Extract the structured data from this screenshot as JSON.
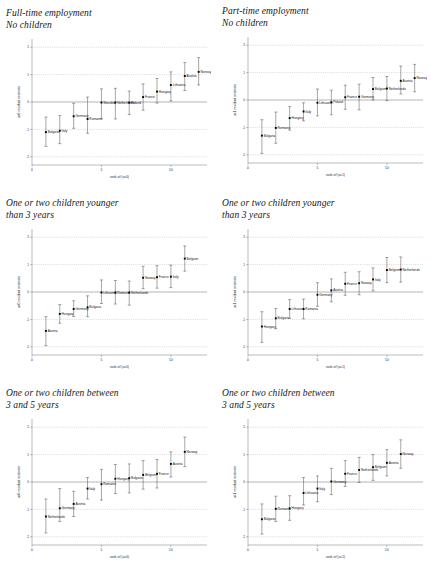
{
  "figure": {
    "width": 431,
    "height": 577,
    "background": "#ffffff",
    "marker_color": "#000000",
    "grid_color": "#9a9a9a",
    "axis_color": "#666666"
  },
  "panels": [
    {
      "id": "panel-fulltime-nochildren",
      "title": "Full-time employment\nNo children",
      "chart_data": {
        "type": "scatter",
        "title": "Full-time employment No children",
        "xlabel": "rank of (uc0)",
        "ylabel": "uc0 residual estimate",
        "xlim": [
          0,
          12.6
        ],
        "ylim": [
          -2.3,
          2.3
        ],
        "xticks": [
          0,
          5,
          10
        ],
        "xticklabels": [
          "0",
          "5",
          "10"
        ],
        "yticks": [
          -2,
          -1,
          0,
          1,
          2
        ],
        "yticklabels": [
          "-2",
          "-1",
          "0",
          "1",
          "2"
        ],
        "grid": true,
        "zero_reference_line": 0,
        "legend": "none",
        "categories": [
          "Bulgaria",
          "Italy",
          "Germany",
          "Romania",
          "Hungary",
          "Poland",
          "Netherlands",
          "France",
          "Hungary",
          "Lithuania",
          "Austria",
          "Norway"
        ],
        "points": [
          {
            "x": 1,
            "label": "Bulgaria",
            "y": -1.1,
            "lo": -1.62,
            "hi": -0.55
          },
          {
            "x": 2,
            "label": "Italy",
            "y": -1.05,
            "lo": -1.52,
            "hi": -0.5
          },
          {
            "x": 3,
            "label": "Germany",
            "y": -0.52,
            "lo": -0.96,
            "hi": -0.05
          },
          {
            "x": 4,
            "label": "Romania",
            "y": -0.62,
            "lo": -1.14,
            "hi": 0.18
          },
          {
            "x": 5,
            "label": "Slovakia",
            "y": -0.02,
            "lo": -0.6,
            "hi": 0.48
          },
          {
            "x": 6,
            "label": "Netherlands",
            "y": -0.02,
            "lo": -0.62,
            "hi": 0.5
          },
          {
            "x": 7,
            "label": "Poland",
            "y": -0.02,
            "lo": -0.46,
            "hi": 0.4
          },
          {
            "x": 8,
            "label": "France",
            "y": 0.18,
            "lo": -0.3,
            "hi": 0.66
          },
          {
            "x": 9,
            "label": "Hungary",
            "y": 0.38,
            "lo": -0.04,
            "hi": 0.86
          },
          {
            "x": 10,
            "label": "Lithuania",
            "y": 0.62,
            "lo": 0.04,
            "hi": 1.1
          },
          {
            "x": 11,
            "label": "Austria",
            "y": 0.95,
            "lo": 0.42,
            "hi": 1.44
          },
          {
            "x": 12,
            "label": "Norway",
            "y": 1.1,
            "lo": 0.62,
            "hi": 1.62
          }
        ]
      }
    },
    {
      "id": "panel-parttime-nochildren",
      "title": "Part-time employment\nNo children",
      "chart_data": {
        "type": "scatter",
        "title": "Part-time employment No children",
        "xlabel": "rank of (uc1)",
        "ylabel": "uc1 residual estimate",
        "xlim": [
          0,
          12.6
        ],
        "ylim": [
          -2.3,
          2.3
        ],
        "xticks": [
          0,
          5,
          10
        ],
        "xticklabels": [
          "0",
          "5",
          "10"
        ],
        "yticks": [
          -2,
          -1,
          0,
          1,
          2
        ],
        "yticklabels": [
          "-2",
          "-1",
          "0",
          "1",
          "2"
        ],
        "grid": true,
        "zero_reference_line": 0,
        "legend": "none",
        "categories": [
          "Bulgaria",
          "Romania",
          "Hungary",
          "Italy",
          "Lithuania",
          "France",
          "Germany",
          "Belgium",
          "Netherlands",
          "Austria",
          "Norway"
        ],
        "points": [
          {
            "x": 1,
            "label": "Bulgaria",
            "y": -1.3,
            "lo": -1.95,
            "hi": -0.72
          },
          {
            "x": 2,
            "label": "Romania",
            "y": -1.02,
            "lo": -1.58,
            "hi": -0.44
          },
          {
            "x": 3,
            "label": "Hungary",
            "y": -0.66,
            "lo": -1.1,
            "hi": -0.24
          },
          {
            "x": 4,
            "label": "Italy",
            "y": -0.42,
            "lo": -0.76,
            "hi": -0.1
          },
          {
            "x": 5,
            "label": "Lithuania",
            "y": -0.1,
            "lo": -0.58,
            "hi": 0.4
          },
          {
            "x": 6,
            "label": "Poland",
            "y": -0.08,
            "lo": -0.54,
            "hi": 0.36
          },
          {
            "x": 7,
            "label": "France",
            "y": 0.1,
            "lo": -0.34,
            "hi": 0.54
          },
          {
            "x": 8,
            "label": "Germany",
            "y": 0.12,
            "lo": -0.36,
            "hi": 0.58
          },
          {
            "x": 9,
            "label": "Belgium",
            "y": 0.4,
            "lo": 0.0,
            "hi": 0.82
          },
          {
            "x": 10,
            "label": "Netherlands",
            "y": 0.42,
            "lo": -0.02,
            "hi": 0.86
          },
          {
            "x": 11,
            "label": "Austria",
            "y": 0.7,
            "lo": 0.22,
            "hi": 1.24
          },
          {
            "x": 12,
            "label": "Norway",
            "y": 0.8,
            "lo": 0.3,
            "hi": 1.3
          }
        ]
      }
    },
    {
      "id": "panel-younger3-uc0",
      "title": "One or two children younger\nthan 3 years",
      "chart_data": {
        "type": "scatter",
        "title": "One or two children younger than 3 years",
        "xlabel": "rank of (uc0)",
        "ylabel": "uc0 residual estimate",
        "xlim": [
          0,
          12.6
        ],
        "ylim": [
          -2.3,
          2.3
        ],
        "xticks": [
          0,
          5,
          10
        ],
        "xticklabels": [
          "0",
          "5",
          "10"
        ],
        "yticks": [
          -2,
          -1,
          0,
          1,
          2
        ],
        "yticklabels": [
          "-2",
          "-1",
          "0",
          "1",
          "2"
        ],
        "grid": true,
        "zero_reference_line": 0,
        "legend": "none",
        "categories": [
          "Austria",
          "Hungary",
          "Germany",
          "Bulgaria",
          "Lithuania",
          "Romania",
          "Netherlands",
          "Norway",
          "France",
          "Italy",
          "Belgium"
        ],
        "points": [
          {
            "x": 1,
            "label": "Austria",
            "y": -1.42,
            "lo": -1.96,
            "hi": -0.9
          },
          {
            "x": 2,
            "label": "Hungary",
            "y": -0.8,
            "lo": -1.14,
            "hi": -0.46
          },
          {
            "x": 3,
            "label": "Germany",
            "y": -0.62,
            "lo": -0.9,
            "hi": -0.32
          },
          {
            "x": 4,
            "label": "Bulgaria",
            "y": -0.56,
            "lo": -0.9,
            "hi": -0.14
          },
          {
            "x": 5,
            "label": "Lithuania",
            "y": -0.02,
            "lo": -0.42,
            "hi": 0.44
          },
          {
            "x": 6,
            "label": "Romania",
            "y": -0.02,
            "lo": -0.44,
            "hi": 0.42
          },
          {
            "x": 7,
            "label": "Netherlands",
            "y": -0.02,
            "lo": -0.48,
            "hi": 0.4
          },
          {
            "x": 8,
            "label": "Norway",
            "y": 0.52,
            "lo": 0.12,
            "hi": 0.94
          },
          {
            "x": 9,
            "label": "France",
            "y": 0.54,
            "lo": 0.14,
            "hi": 0.96
          },
          {
            "x": 10,
            "label": "Italy",
            "y": 0.56,
            "lo": 0.16,
            "hi": 0.98
          },
          {
            "x": 11,
            "label": "Belgium",
            "y": 1.22,
            "lo": 0.76,
            "hi": 1.68
          }
        ]
      }
    },
    {
      "id": "panel-younger3-uc1",
      "title": "One or two children younger\nthan 3 years",
      "chart_data": {
        "type": "scatter",
        "title": "One or two children younger than 3 years",
        "xlabel": "rank of (uc1)",
        "ylabel": "uc1 residual estimate",
        "xlim": [
          0,
          12.6
        ],
        "ylim": [
          -2.3,
          2.3
        ],
        "xticks": [
          0,
          5,
          10
        ],
        "xticklabels": [
          "0",
          "5",
          "10"
        ],
        "yticks": [
          -2,
          -1,
          0,
          1,
          2
        ],
        "yticklabels": [
          "-2",
          "-1",
          "0",
          "1",
          "2"
        ],
        "grid": true,
        "zero_reference_line": 0,
        "legend": "none",
        "categories": [
          "Hungary",
          "Bulgaria",
          "Lithuania",
          "Romania",
          "Germany",
          "Austria",
          "France",
          "Norway",
          "Italy",
          "Belgium",
          "Netherlands"
        ],
        "points": [
          {
            "x": 1,
            "label": "Hungary",
            "y": -1.26,
            "lo": -1.84,
            "hi": -0.72
          },
          {
            "x": 2,
            "label": "Bulgaria",
            "y": -0.96,
            "lo": -1.34,
            "hi": -0.6
          },
          {
            "x": 3,
            "label": "Lithuania",
            "y": -0.62,
            "lo": -0.96,
            "hi": -0.28
          },
          {
            "x": 4,
            "label": "Romania",
            "y": -0.62,
            "lo": -0.98,
            "hi": -0.26
          },
          {
            "x": 5,
            "label": "Germany",
            "y": -0.1,
            "lo": -0.52,
            "hi": 0.34
          },
          {
            "x": 6,
            "label": "Austria",
            "y": 0.06,
            "lo": -0.36,
            "hi": 0.48
          },
          {
            "x": 7,
            "label": "France",
            "y": 0.3,
            "lo": -0.12,
            "hi": 0.72
          },
          {
            "x": 8,
            "label": "Norway",
            "y": 0.32,
            "lo": -0.1,
            "hi": 0.74
          },
          {
            "x": 9,
            "label": "Italy",
            "y": 0.46,
            "lo": 0.04,
            "hi": 0.88
          },
          {
            "x": 10,
            "label": "Belgium",
            "y": 0.8,
            "lo": 0.34,
            "hi": 1.26
          },
          {
            "x": 11,
            "label": "Netherlands",
            "y": 0.82,
            "lo": 0.36,
            "hi": 1.28
          }
        ]
      }
    },
    {
      "id": "panel-between35-uc0",
      "title": "One or two children between\n3 and 5 years",
      "chart_data": {
        "type": "scatter",
        "title": "One or two children between 3 and 5 years",
        "xlabel": "rank of (uc0)",
        "ylabel": "uc0 residual estimate",
        "xlim": [
          0,
          12.6
        ],
        "ylim": [
          -2.3,
          2.3
        ],
        "xticks": [
          0,
          5,
          10
        ],
        "xticklabels": [
          "0",
          "5",
          "10"
        ],
        "yticks": [
          -2,
          -1,
          0,
          1,
          2
        ],
        "yticklabels": [
          "-2",
          "-1",
          "0",
          "1",
          "2"
        ],
        "grid": true,
        "zero_reference_line": 0,
        "legend": "none",
        "categories": [
          "Netherlands",
          "Germany",
          "Austria",
          "Italy",
          "Romania",
          "Hungary",
          "Bulgaria",
          "Belgium",
          "France",
          "Austria",
          "Norway"
        ],
        "points": [
          {
            "x": 1,
            "label": "Netherlands",
            "y": -1.26,
            "lo": -1.86,
            "hi": -0.62
          },
          {
            "x": 2,
            "label": "Germany",
            "y": -0.96,
            "lo": -1.44,
            "hi": -0.24
          },
          {
            "x": 3,
            "label": "Austria",
            "y": -0.8,
            "lo": -1.26,
            "hi": -0.34
          },
          {
            "x": 4,
            "label": "Italy",
            "y": -0.24,
            "lo": -0.62,
            "hi": 0.16
          },
          {
            "x": 5,
            "label": "Romania",
            "y": -0.08,
            "lo": -0.66,
            "hi": 0.46
          },
          {
            "x": 6,
            "label": "Hungary",
            "y": 0.12,
            "lo": -0.42,
            "hi": 0.64
          },
          {
            "x": 7,
            "label": "Bulgaria",
            "y": 0.14,
            "lo": -0.4,
            "hi": 0.66
          },
          {
            "x": 8,
            "label": "Belgium",
            "y": 0.26,
            "lo": -0.26,
            "hi": 0.78
          },
          {
            "x": 9,
            "label": "France",
            "y": 0.3,
            "lo": -0.22,
            "hi": 0.82
          },
          {
            "x": 10,
            "label": "Austria",
            "y": 0.66,
            "lo": 0.18,
            "hi": 1.1
          },
          {
            "x": 11,
            "label": "Norway",
            "y": 1.1,
            "lo": 0.56,
            "hi": 1.64
          }
        ]
      }
    },
    {
      "id": "panel-between35-uc1",
      "title": "One or two children between\n3 and 5 years",
      "chart_data": {
        "type": "scatter",
        "title": "One or two children between 3 and 5 years",
        "xlabel": "rank of (uc1)",
        "ylabel": "uc1 residual estimate",
        "xlim": [
          0,
          12.6
        ],
        "ylim": [
          -2.3,
          2.3
        ],
        "xticks": [
          0,
          5,
          10
        ],
        "xticklabels": [
          "0",
          "5",
          "10"
        ],
        "yticks": [
          -2,
          -1,
          0,
          1,
          2
        ],
        "yticklabels": [
          "-2",
          "-1",
          "0",
          "1",
          "2"
        ],
        "grid": true,
        "zero_reference_line": 0,
        "legend": "none",
        "categories": [
          "Bulgaria",
          "Romania",
          "Hungary",
          "Lithuania",
          "Italy",
          "Germany",
          "France",
          "Netherlands",
          "Belgium",
          "Austria",
          "Norway"
        ],
        "points": [
          {
            "x": 1,
            "label": "Bulgaria",
            "y": -1.36,
            "lo": -1.9,
            "hi": -0.8
          },
          {
            "x": 2,
            "label": "Romania",
            "y": -0.98,
            "lo": -1.44,
            "hi": -0.52
          },
          {
            "x": 3,
            "label": "Hungary",
            "y": -0.96,
            "lo": -1.4,
            "hi": -0.5
          },
          {
            "x": 4,
            "label": "Lithuania",
            "y": -0.4,
            "lo": -0.84,
            "hi": 0.16
          },
          {
            "x": 5,
            "label": "Italy",
            "y": -0.24,
            "lo": -0.72,
            "hi": 0.22
          },
          {
            "x": 6,
            "label": "Germany",
            "y": 0.02,
            "lo": -0.46,
            "hi": 0.5
          },
          {
            "x": 7,
            "label": "France",
            "y": 0.3,
            "lo": -0.16,
            "hi": 0.78
          },
          {
            "x": 8,
            "label": "Netherlands",
            "y": 0.44,
            "lo": -0.02,
            "hi": 0.9
          },
          {
            "x": 9,
            "label": "Belgium",
            "y": 0.54,
            "lo": 0.06,
            "hi": 1.0
          },
          {
            "x": 10,
            "label": "Austria",
            "y": 0.7,
            "lo": 0.22,
            "hi": 1.18
          },
          {
            "x": 11,
            "label": "Norway",
            "y": 1.02,
            "lo": 0.5,
            "hi": 1.54
          }
        ]
      }
    }
  ]
}
